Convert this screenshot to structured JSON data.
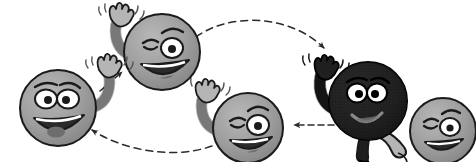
{
  "canvas": {
    "width": 476,
    "height": 162,
    "background": "#ffffff",
    "description": "Cartoon illustration of five waving smiley-face characters arranged in a cyclical loop connected by dashed arrows"
  },
  "palette": {
    "outline": "#1a1a1a",
    "body_gray": "#9d9d9d",
    "body_gray_shade": "#7e7e7e",
    "body_gray_light": "#b5b5b5",
    "body_dark": "#1f1f1f",
    "body_dark_shade": "#000000",
    "eye_white": "#ffffff",
    "mouth_dark": "#2b2b2b",
    "tongue": "#6e6e6e",
    "arrow": "#2b2b2b",
    "motion_line": "#555555"
  },
  "characters": [
    {
      "id": "smiley-left",
      "name": "smiley-face-left",
      "cx": 58,
      "cy": 108,
      "r": 38,
      "fill": "#9d9d9d",
      "expression": "open-mouth-grin",
      "eyes": "both-open",
      "arm_side": "right",
      "waving": true,
      "label": "Character 1 (gray, waving, left)"
    },
    {
      "id": "smiley-top",
      "name": "smiley-face-top-center",
      "cx": 162,
      "cy": 52,
      "r": 38,
      "fill": "#9d9d9d",
      "expression": "wide-grin",
      "eyes": "winking",
      "arm_side": "left",
      "waving": true,
      "label": "Character 2 (gray, waving, top-center)"
    },
    {
      "id": "smiley-dark",
      "name": "smiley-face-dark-right",
      "cx": 368,
      "cy": 101,
      "r": 39,
      "fill": "#1f1f1f",
      "expression": "small-smile",
      "eyes": "both-open",
      "arm_side": "left",
      "waving": true,
      "has_legs": true,
      "label": "Character 4 (dark, waving with legs, right)"
    },
    {
      "id": "smiley-far-right",
      "name": "smiley-face-far-right",
      "cx": 443,
      "cy": 131,
      "r": 33,
      "fill": "#9d9d9d",
      "expression": "open-grin",
      "eyes": "winking",
      "arm_side": "none",
      "waving": false,
      "label": "Character 5 (gray, partially hidden, far right)"
    },
    {
      "id": "smiley-bottom",
      "name": "smiley-face-bottom-center",
      "cx": 248,
      "cy": 128,
      "r": 35,
      "fill": "#9d9d9d",
      "expression": "open-grin",
      "eyes": "winking",
      "arm_side": "left",
      "waving": true,
      "label": "Character 3 (gray, waving, bottom-center)"
    }
  ],
  "arrows": [
    {
      "id": "arrow-left-to-top",
      "name": "arrow-left-to-top",
      "style": "dashed",
      "shape": "straight",
      "direction": "up-right",
      "from": [
        100,
        90
      ],
      "to": [
        124,
        71
      ],
      "label": "dashed arrow pointing up-right from left character to top character"
    },
    {
      "id": "arrow-top-to-dark",
      "name": "arrow-top-to-dark",
      "style": "dashed",
      "shape": "arc",
      "direction": "right-descending",
      "from": [
        195,
        38
      ],
      "to": [
        327,
        53
      ],
      "label": "dashed arc arrow from top-center character to dark character"
    },
    {
      "id": "arrow-dark-to-bottom",
      "name": "arrow-dark-to-bottom",
      "style": "dashed",
      "shape": "straight",
      "direction": "left",
      "from": [
        330,
        125
      ],
      "to": [
        290,
        125
      ],
      "label": "short dashed arrow pointing left"
    },
    {
      "id": "arrow-bottom-to-left",
      "name": "arrow-bottom-to-left",
      "style": "dashed",
      "shape": "arc",
      "direction": "left-ascending",
      "from": [
        212,
        145
      ],
      "to": [
        88,
        129
      ],
      "label": "dashed arc arrow from bottom-center character back to left character"
    }
  ]
}
